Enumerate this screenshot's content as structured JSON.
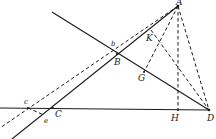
{
  "diagram": {
    "type": "geometric-construction",
    "points": {
      "A": {
        "label": "A",
        "x": 178,
        "y": 6
      },
      "B": {
        "label": "B",
        "x": 117,
        "y": 54
      },
      "b": {
        "label": "b",
        "x": 114,
        "y": 48
      },
      "C": {
        "label": "C",
        "x": 53,
        "y": 108
      },
      "c": {
        "label": "c",
        "x": 28,
        "y": 108
      },
      "D": {
        "label": "D",
        "x": 209,
        "y": 110
      },
      "e": {
        "label": "e",
        "x": 43,
        "y": 114
      },
      "G": {
        "label": "G",
        "x": 144,
        "y": 72
      },
      "H": {
        "label": "H",
        "x": 178,
        "y": 110
      },
      "K": {
        "label": "K",
        "x": 159,
        "y": 42
      }
    },
    "labels": {
      "A": "A",
      "B": "B",
      "b": "b",
      "C": "C",
      "c": "c",
      "D": "D",
      "e": "e",
      "G": "G",
      "H": "H",
      "K": "K"
    },
    "lines": [
      {
        "id": "baseline",
        "style": "solid",
        "from": "left-edge",
        "to": "D"
      },
      {
        "id": "line-through-B-G-to-D",
        "style": "solid",
        "from": "upper-left",
        "to": "D"
      },
      {
        "id": "line-A-B-C",
        "style": "solid",
        "from": "A",
        "to": "lower-left"
      },
      {
        "id": "line-A-b-c",
        "style": "dashed",
        "from": "A",
        "to": "lower-left"
      },
      {
        "id": "line-A-H",
        "style": "dashed",
        "from": "A",
        "to": "H"
      },
      {
        "id": "line-A-G",
        "style": "dashed",
        "from": "A",
        "to": "G"
      },
      {
        "id": "line-A-D",
        "style": "dashed",
        "from": "A",
        "to": "D"
      },
      {
        "id": "line-K-D",
        "style": "dashed",
        "from": "K",
        "to": "D"
      },
      {
        "id": "line-c-e",
        "style": "dashed",
        "from": "c",
        "to": "e"
      }
    ]
  }
}
